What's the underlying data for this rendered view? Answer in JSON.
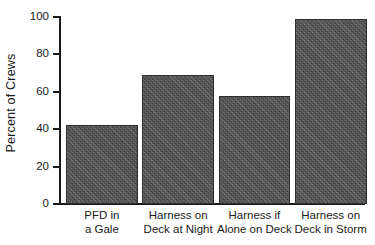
{
  "chart_data": {
    "type": "bar",
    "title": "",
    "xlabel": "",
    "ylabel": "Percent of Crews",
    "categories": [
      "PFD in a Gale",
      "Harness on Deck at Night",
      "Harness if Alone on Deck",
      "Harness on Deck in Storm"
    ],
    "category_lines": [
      [
        "PFD in",
        "a Gale"
      ],
      [
        "Harness on",
        "Deck at Night"
      ],
      [
        "Harness if",
        "Alone on Deck"
      ],
      [
        "Harness on",
        "Deck in Storm"
      ]
    ],
    "values": [
      42,
      69,
      58,
      99
    ],
    "ylim": [
      0,
      100
    ],
    "ytick_values": [
      0,
      20,
      40,
      60,
      80,
      100
    ],
    "ytick_labels": [
      "0",
      "20",
      "40",
      "60",
      "80",
      "100"
    ],
    "grid": false,
    "legend": false,
    "bar_color": "#5b5b5b",
    "bar_edge_color": "#2e2e2e",
    "axis_color": "#1a1a1a",
    "background_color": "#ffffff"
  }
}
